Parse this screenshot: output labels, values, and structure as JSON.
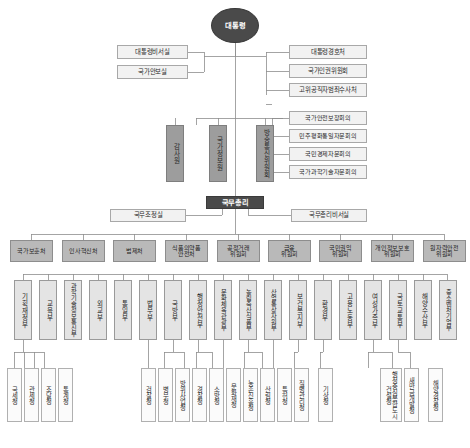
{
  "chart": {
    "colors": {
      "dark": "#4a4a4a",
      "gray_agency": "#9d9d9d",
      "commission": "#b9b9b9",
      "ministry": "#e4e4e4",
      "agency": "#fbfbfb",
      "line": "#8d8d8d"
    }
  },
  "president": {
    "label": "대통령"
  },
  "president_left_offices": [
    {
      "label": "대통령비서실"
    },
    {
      "label": "국가안보실"
    }
  ],
  "president_right_offices": [
    {
      "label": "대통령경호처"
    },
    {
      "label": "국가인권위원회"
    },
    {
      "label": "고위공직자범죄수사처"
    }
  ],
  "advisory_councils": [
    {
      "label": "국가안전보장회의"
    },
    {
      "label": "민주평화통일자문회의"
    },
    {
      "label": "국민경제자문회의"
    },
    {
      "label": "국가과학기술자문회의"
    }
  ],
  "independent_agencies": [
    {
      "label": "감사원"
    },
    {
      "label": "국가정보원"
    },
    {
      "label": "방송통신위원회"
    }
  ],
  "prime_minister": {
    "label": "국무총리"
  },
  "pm_offices": [
    {
      "label": "국무조정실"
    },
    {
      "label": "국무총리비서실"
    }
  ],
  "commissions": [
    {
      "label": "국가보훈처"
    },
    {
      "label": "인사혁신처"
    },
    {
      "label": "법제처"
    },
    {
      "label": "식품의약품\n안전처"
    },
    {
      "label": "공정거래\n위원회"
    },
    {
      "label": "금융\n위원회"
    },
    {
      "label": "국민권익\n위원회"
    },
    {
      "label": "개인정보보호\n위원회"
    },
    {
      "label": "원자력안전\n위원회"
    }
  ],
  "ministries": [
    {
      "label": "기획재정부"
    },
    {
      "label": "교육부"
    },
    {
      "label": "과학기술정보통신부"
    },
    {
      "label": "외교부"
    },
    {
      "label": "통일부"
    },
    {
      "label": "법무부"
    },
    {
      "label": "국방부"
    },
    {
      "label": "행정안전부"
    },
    {
      "label": "문화체육관광부"
    },
    {
      "label": "농림축산식품부"
    },
    {
      "label": "산업통상자원부"
    },
    {
      "label": "보건복지부"
    },
    {
      "label": "환경부"
    },
    {
      "label": "고용노동부"
    },
    {
      "label": "여성가족부"
    },
    {
      "label": "국토교통부"
    },
    {
      "label": "해양수산부"
    },
    {
      "label": "중소벤처기업부"
    }
  ],
  "agencies": [
    {
      "label": "국세청"
    },
    {
      "label": "관세청"
    },
    {
      "label": "조달청"
    },
    {
      "label": "통계청"
    },
    {
      "label": "검찰청"
    },
    {
      "label": "병무청"
    },
    {
      "label": "방위사업청"
    },
    {
      "label": "경찰청"
    },
    {
      "label": "소방청"
    },
    {
      "label": "문화재청"
    },
    {
      "label": "농촌진흥청"
    },
    {
      "label": "산림청"
    },
    {
      "label": "특허청"
    },
    {
      "label": "질병관리청"
    },
    {
      "label": "기상청"
    },
    {
      "label": "행정중심복합도시건설청"
    },
    {
      "label": "새만금개발청"
    },
    {
      "label": "해양경찰청"
    }
  ]
}
